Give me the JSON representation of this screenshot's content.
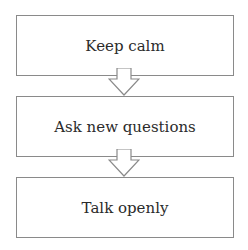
{
  "diagram": {
    "type": "flowchart",
    "direction": "top-to-bottom",
    "steps": [
      {
        "label": "Keep calm"
      },
      {
        "label": "Ask new questions"
      },
      {
        "label": "Talk openly"
      }
    ],
    "colors": {
      "border": "#8a8a8a",
      "text": "#2b2b2b",
      "arrow_fill": "#ffffff"
    }
  }
}
